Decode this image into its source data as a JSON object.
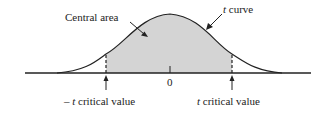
{
  "diagram": {
    "labels": {
      "central_area": "Central area",
      "t_curve_italic": "t",
      "t_curve_rest": " curve",
      "zero": "0",
      "neg_prefix": "– ",
      "neg_t": "t",
      "neg_rest": " critical value",
      "pos_t": "t",
      "pos_rest": " critical value"
    },
    "colors": {
      "shade": "#d4d4d4",
      "line": "#222222"
    }
  }
}
